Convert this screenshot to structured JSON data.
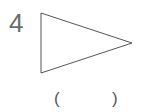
{
  "question": {
    "number": "4",
    "shape": {
      "type": "triangle",
      "vertices": [
        [
          41,
          13
        ],
        [
          132,
          43
        ],
        [
          41,
          73
        ]
      ],
      "stroke_color": "#555555"
    },
    "answer": {
      "open_paren": "(",
      "close_paren": ")",
      "value": ""
    }
  }
}
